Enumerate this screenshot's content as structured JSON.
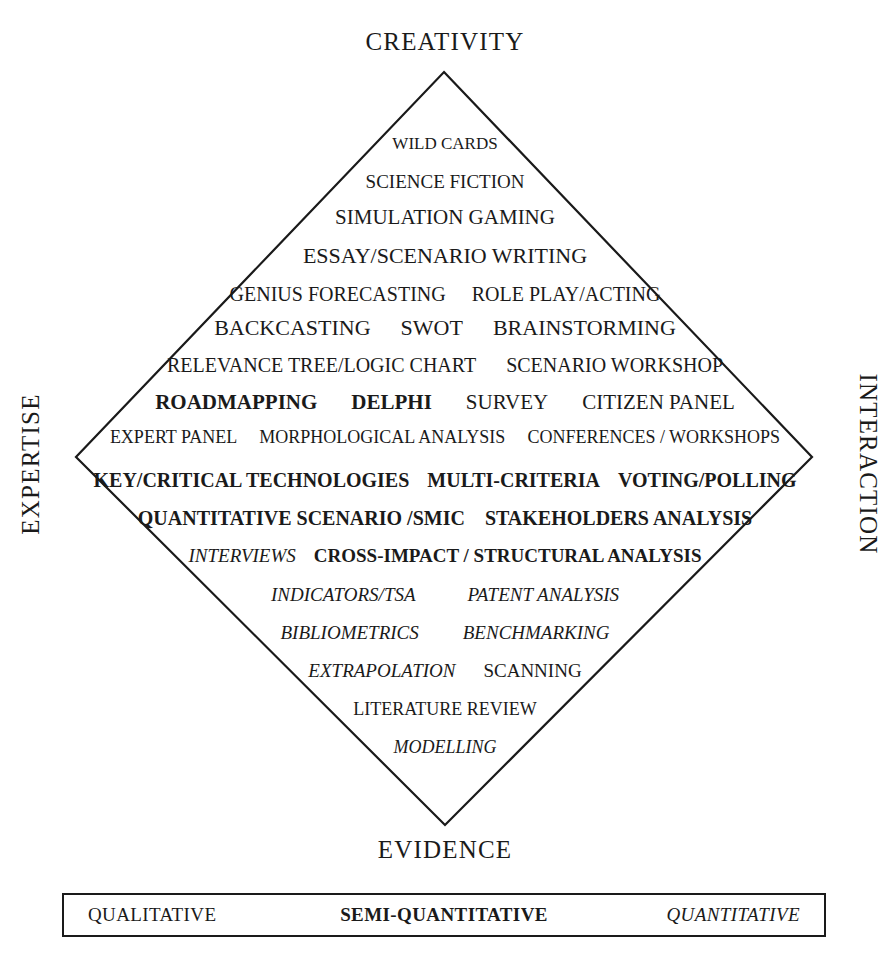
{
  "figure": {
    "axes": {
      "top": "CREATIVITY",
      "bottom": "EVIDENCE",
      "left": "EXPERTISE",
      "right": "INTERACTION"
    }
  },
  "rows": [
    {
      "items": [
        {
          "text": "WILD CARDS",
          "style": "normal"
        }
      ]
    },
    {
      "items": [
        {
          "text": "SCIENCE FICTION",
          "style": "normal"
        }
      ]
    },
    {
      "items": [
        {
          "text": "SIMULATION GAMING",
          "style": "normal"
        }
      ]
    },
    {
      "items": [
        {
          "text": "ESSAY/SCENARIO WRITING",
          "style": "normal"
        }
      ]
    },
    {
      "items": [
        {
          "text": "GENIUS FORECASTING",
          "style": "normal"
        },
        {
          "text": "ROLE PLAY/ACTING",
          "style": "normal"
        }
      ]
    },
    {
      "items": [
        {
          "text": "BACKCASTING",
          "style": "normal"
        },
        {
          "text": "SWOT",
          "style": "normal"
        },
        {
          "text": "BRAINSTORMING",
          "style": "normal"
        }
      ]
    },
    {
      "items": [
        {
          "text": "RELEVANCE TREE/LOGIC CHART",
          "style": "normal"
        },
        {
          "text": "SCENARIO WORKSHOP",
          "style": "normal"
        }
      ]
    },
    {
      "items": [
        {
          "text": "ROADMAPPING",
          "style": "bold"
        },
        {
          "text": "DELPHI",
          "style": "bold"
        },
        {
          "text": "SURVEY",
          "style": "normal"
        },
        {
          "text": "CITIZEN PANEL",
          "style": "normal"
        }
      ]
    },
    {
      "items": [
        {
          "text": "EXPERT PANEL",
          "style": "normal"
        },
        {
          "text": "MORPHOLOGICAL ANALYSIS",
          "style": "normal"
        },
        {
          "text": "CONFERENCES / WORKSHOPS",
          "style": "normal"
        }
      ]
    },
    {
      "items": [
        {
          "text": "KEY/CRITICAL TECHNOLOGIES",
          "style": "bold"
        },
        {
          "text": "MULTI-CRITERIA",
          "style": "bold"
        },
        {
          "text": "VOTING/POLLING",
          "style": "bold"
        }
      ]
    },
    {
      "items": [
        {
          "text": "QUANTITATIVE SCENARIO /SMIC",
          "style": "bold"
        },
        {
          "text": "STAKEHOLDERS ANALYSIS",
          "style": "bold"
        }
      ]
    },
    {
      "items": [
        {
          "text": "INTERVIEWS",
          "style": "italic"
        },
        {
          "text": "CROSS-IMPACT / STRUCTURAL ANALYSIS",
          "style": "bold"
        }
      ]
    },
    {
      "items": [
        {
          "text": "INDICATORS/TSA",
          "style": "italic"
        },
        {
          "text": "PATENT ANALYSIS",
          "style": "italic"
        }
      ]
    },
    {
      "items": [
        {
          "text": "BIBLIOMETRICS",
          "style": "italic"
        },
        {
          "text": "BENCHMARKING",
          "style": "italic"
        }
      ]
    },
    {
      "items": [
        {
          "text": "EXTRAPOLATION",
          "style": "italic"
        },
        {
          "text": "SCANNING",
          "style": "normal"
        }
      ]
    },
    {
      "items": [
        {
          "text": "LITERATURE REVIEW",
          "style": "normal"
        }
      ]
    },
    {
      "items": [
        {
          "text": "MODELLING",
          "style": "italic"
        }
      ]
    }
  ],
  "legend": {
    "qualitative": "QUALITATIVE",
    "semi_quantitative": "SEMI-QUANTITATIVE",
    "quantitative": "QUANTITATIVE"
  },
  "style": {
    "line_color": "#1a1a1a",
    "text_color": "#1a1a1a",
    "background": "#ffffff"
  },
  "geometry": {
    "diamond": {
      "top_x": 444,
      "top_y": 72,
      "right_x": 812,
      "right_y": 457,
      "bottom_x": 445,
      "bottom_y": 825,
      "left_x": 76,
      "left_y": 457
    },
    "row_tops": [
      135,
      172,
      207,
      245,
      284,
      317,
      355,
      392,
      428,
      470,
      508,
      546,
      585,
      623,
      661,
      700,
      738
    ],
    "row_font_sizes": [
      17,
      19,
      21,
      22,
      20,
      22,
      20,
      21,
      18,
      20,
      20,
      19,
      19,
      19,
      19,
      18,
      18
    ],
    "row_gaps": [
      0,
      0,
      0,
      0,
      26,
      30,
      30,
      34,
      22,
      18,
      20,
      18,
      52,
      44,
      28,
      0,
      0
    ]
  }
}
